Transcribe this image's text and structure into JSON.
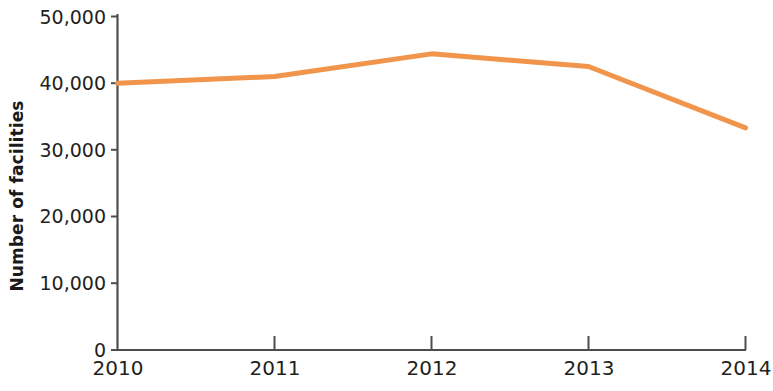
{
  "chart_data": {
    "type": "line",
    "title": "",
    "subtitle": "",
    "xlabel": "",
    "ylabel": "Number of facilities",
    "x": [
      2010,
      2011,
      2012,
      2013,
      2014
    ],
    "categories": [
      "2010",
      "2011",
      "2012",
      "2013",
      "2014"
    ],
    "series": [
      {
        "name": "Number of facilities",
        "color": "#F0954B",
        "values": [
          40000,
          41000,
          44400,
          42500,
          33300
        ]
      }
    ],
    "xlim": [
      2010,
      2014
    ],
    "ylim": [
      0,
      50000
    ],
    "ytick_values": [
      0,
      10000,
      20000,
      30000,
      40000,
      50000
    ],
    "ytick_labels": [
      "0",
      "10,000",
      "20,000",
      "30,000",
      "40,000",
      "50,000"
    ],
    "xtick_labels": [
      "2010",
      "2011",
      "2012",
      "2013",
      "2014"
    ],
    "grid": false,
    "legend": false,
    "legend_position": "none"
  },
  "axes": {
    "y_axis_title": "Number of facilities",
    "y_ticks": [
      {
        "label": "50,000",
        "value": 50000
      },
      {
        "label": "40,000",
        "value": 40000
      },
      {
        "label": "30,000",
        "value": 30000
      },
      {
        "label": "20,000",
        "value": 20000
      },
      {
        "label": "10,000",
        "value": 10000
      },
      {
        "label": "0",
        "value": 0
      }
    ],
    "x_ticks": [
      {
        "label": "2010",
        "value": 2010
      },
      {
        "label": "2011",
        "value": 2011
      },
      {
        "label": "2012",
        "value": 2012
      },
      {
        "label": "2013",
        "value": 2013
      },
      {
        "label": "2014",
        "value": 2014
      }
    ]
  },
  "colors": {
    "line": "#F0954B",
    "axis": "#4d4d4d",
    "text": "#231f20"
  }
}
